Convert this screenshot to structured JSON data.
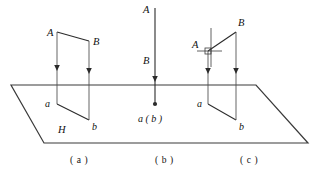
{
  "figure": {
    "type": "geometry-diagram",
    "plane": {
      "label": "H",
      "label_position": {
        "x": 58,
        "y": 133
      },
      "outline_points": "11,85 256,85 308,143 44,143",
      "top_edge_y": 85
    },
    "panels": [
      {
        "id": "a",
        "caption": "( a )",
        "caption_position": {
          "x": 86,
          "y": 163
        },
        "points": {
          "A": {
            "label": "A",
            "x": 47,
            "y": 36
          },
          "B": {
            "label": "B",
            "x": 93,
            "y": 45
          },
          "a": {
            "label": "a",
            "x": 53,
            "y": 107
          },
          "b": {
            "label": "b",
            "x": 92,
            "y": 126
          }
        },
        "segments": [
          {
            "name": "AB-upper",
            "x1": 57,
            "y1": 32,
            "x2": 89,
            "y2": 41
          },
          {
            "name": "ab-lower",
            "x1": 57,
            "y1": 104,
            "x2": 89,
            "y2": 120
          },
          {
            "name": "Aa-projector",
            "x1": 57,
            "y1": 32,
            "x2": 57,
            "y2": 104
          },
          {
            "name": "Bb-projector",
            "x1": 89,
            "y1": 41,
            "x2": 89,
            "y2": 120
          }
        ],
        "arrows": [
          {
            "x": 57,
            "y": 69
          },
          {
            "x": 89,
            "y": 72
          }
        ]
      },
      {
        "id": "b",
        "caption": "( b )",
        "caption_position": {
          "x": 168,
          "y": 163
        },
        "points": {
          "A": {
            "label": "A",
            "x": 146,
            "y": 13
          },
          "B": {
            "label": "B",
            "x": 146,
            "y": 62
          },
          "ab": {
            "label": "a ( b )",
            "x": 140,
            "y": 121
          }
        },
        "segments": [
          {
            "name": "AB-vertical",
            "x1": 155,
            "y1": 8,
            "x2": 155,
            "y2": 104
          }
        ],
        "arrows": [
          {
            "x": 155,
            "y": 80
          }
        ],
        "dot": {
          "x": 155,
          "y": 104,
          "r": 2.1
        }
      },
      {
        "id": "c",
        "caption": "( c )",
        "caption_position": {
          "x": 253,
          "y": 163
        },
        "points": {
          "A": {
            "label": "A",
            "x": 196,
            "y": 48
          },
          "B": {
            "label": "B",
            "x": 235,
            "y": 26
          },
          "a": {
            "label": "a",
            "x": 198,
            "y": 107
          },
          "b": {
            "label": "b",
            "x": 239,
            "y": 126
          }
        },
        "segments": [
          {
            "name": "AB-upper",
            "x1": 208,
            "y1": 51,
            "x2": 236,
            "y2": 32
          },
          {
            "name": "ab-lower",
            "x1": 208,
            "y1": 104,
            "x2": 236,
            "y2": 120
          },
          {
            "name": "Aa-projector",
            "x1": 208,
            "y1": 51,
            "x2": 208,
            "y2": 104
          },
          {
            "name": "Bb-projector",
            "x1": 236,
            "y1": 32,
            "x2": 236,
            "y2": 120
          }
        ],
        "arrows": [
          {
            "x": 208,
            "y": 72
          },
          {
            "x": 236,
            "y": 72
          }
        ],
        "perpendicular_mark": {
          "name": "right-angle-mark",
          "center": {
            "x": 208,
            "y": 51
          },
          "square_size": 6,
          "tick_h": {
            "x1": 196,
            "y1": 51,
            "x2": 222,
            "y2": 51
          },
          "tick_v": {
            "x1": 208,
            "y1": 28,
            "x2": 208,
            "y2": 66
          }
        }
      }
    ],
    "colors": {
      "line": "#2b2b2b",
      "plane": "#3a3a3a",
      "text": "#111111",
      "background": "#ffffff"
    }
  }
}
